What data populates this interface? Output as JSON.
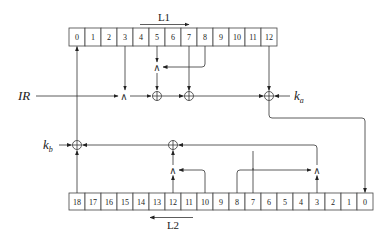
{
  "diagram": {
    "type": "stream-cipher-register-diagram",
    "top_register": {
      "label": "L1",
      "direction": "right",
      "cells": [
        "0",
        "1",
        "2",
        "3",
        "4",
        "5",
        "6",
        "7",
        "8",
        "9",
        "10",
        "11",
        "12"
      ]
    },
    "bottom_register": {
      "label": "L2",
      "direction": "left",
      "cells": [
        "18",
        "17",
        "16",
        "15",
        "14",
        "13",
        "12",
        "11",
        "10",
        "9",
        "8",
        "7",
        "6",
        "5",
        "4",
        "3",
        "2",
        "1",
        "0"
      ]
    },
    "inputs": {
      "ir": "IR",
      "ka_main": "k",
      "ka_sub": "a",
      "kb_main": "k",
      "kb_sub": "b"
    },
    "operators": {
      "xor_symbol": "⊕",
      "and_symbol": "∧"
    },
    "connections": [
      {
        "from": "L1[3]",
        "to": "AND1"
      },
      {
        "from": "IR",
        "to": "AND1"
      },
      {
        "from": "L1[5]",
        "to": "AND2"
      },
      {
        "from": "L1[8]",
        "to": "AND2"
      },
      {
        "from": "AND1",
        "to": "XOR1"
      },
      {
        "from": "AND2",
        "to": "XOR1"
      },
      {
        "from": "XOR1",
        "to": "XOR2"
      },
      {
        "from": "L1[7]",
        "to": "XOR2"
      },
      {
        "from": "XOR2",
        "to": "XOR3"
      },
      {
        "from": "L1[12]",
        "to": "XOR3"
      },
      {
        "from": "k_a",
        "to": "XOR3"
      },
      {
        "from": "XOR3",
        "to": "L2[0]"
      },
      {
        "from": "L2[12]",
        "to": "AND3"
      },
      {
        "from": "L2[10]",
        "to": "AND3"
      },
      {
        "from": "AND3",
        "to": "XOR4"
      },
      {
        "from": "L2[7]",
        "to": "XOR4"
      },
      {
        "from": "L2[3]",
        "to": "AND4"
      },
      {
        "from": "L2[8]",
        "to": "AND4"
      },
      {
        "from": "AND4",
        "to": "XOR4"
      },
      {
        "from": "XOR4",
        "to": "XOR5"
      },
      {
        "from": "L2[18]",
        "to": "XOR5"
      },
      {
        "from": "k_b",
        "to": "XOR5"
      },
      {
        "from": "XOR5",
        "to": "L1[0]"
      }
    ]
  }
}
